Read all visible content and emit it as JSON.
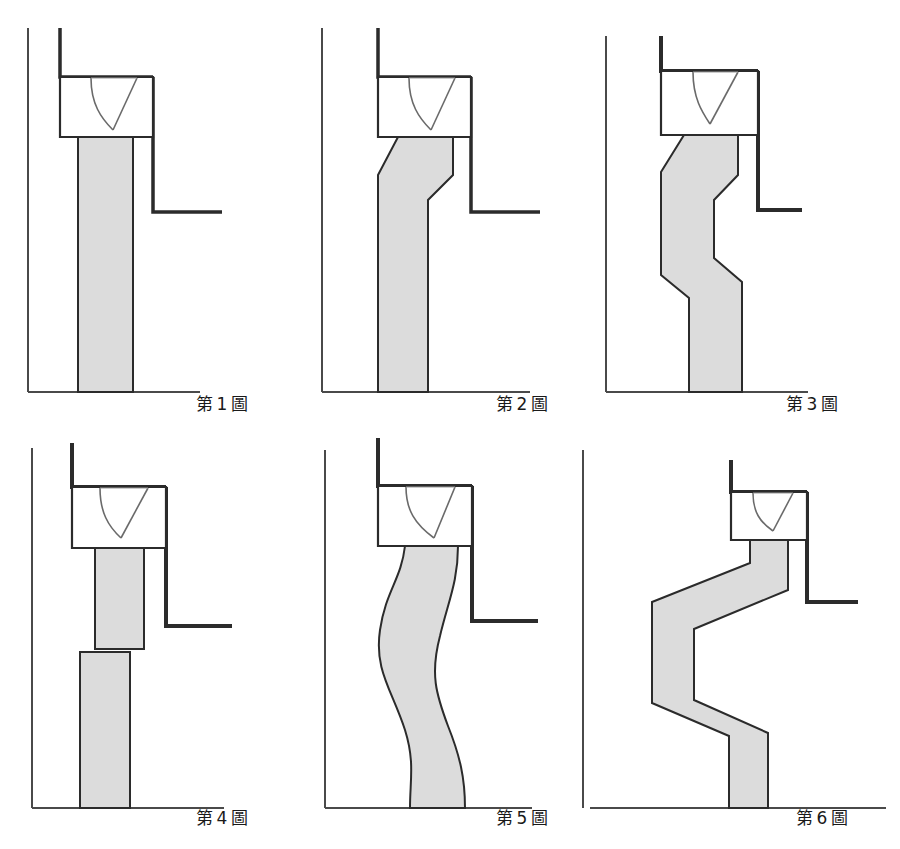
{
  "document": {
    "kind": "patent-drawing-sheet",
    "description": "Six sectional detail figures of a column/pier with a V-notch head connection, showing progressive lateral deviation of the shaft",
    "page_width": 900,
    "page_height": 849
  },
  "style": {
    "shaft_fill": "#dcdcdc",
    "shaft_stroke": "#2b2b2b",
    "wall_stroke": "#2b2b2b",
    "thin_stroke": "#4a4a4a",
    "background": "#ffffff",
    "caption_color": "#1a1a1a"
  },
  "figures": [
    {
      "id": "figure-1",
      "caption_prefix": "第",
      "caption_number": "1",
      "caption_suffix": "圖",
      "caption_full": "第 1 圖",
      "shaft_type": "straight",
      "deviation": "none",
      "notch": "v-notch",
      "head_box": true,
      "ground_line": true
    },
    {
      "id": "figure-2",
      "caption_prefix": "第",
      "caption_number": "2",
      "caption_suffix": "圖",
      "caption_full": "第 2 圖",
      "shaft_type": "single-jog",
      "deviation": "small",
      "notch": "v-notch",
      "head_box": true,
      "ground_line": true
    },
    {
      "id": "figure-3",
      "caption_prefix": "第",
      "caption_number": "3",
      "caption_suffix": "圖",
      "caption_full": "第 3 圖",
      "shaft_type": "double-jog",
      "deviation": "medium",
      "notch": "v-notch",
      "head_box": true,
      "ground_line": true
    },
    {
      "id": "figure-4",
      "caption_prefix": "第",
      "caption_number": "4",
      "caption_suffix": "圖",
      "caption_full": "第 4 圖",
      "shaft_type": "offset-segments",
      "deviation": "discontinuous",
      "notch": "v-notch",
      "head_box": true,
      "ground_line": true
    },
    {
      "id": "figure-5",
      "caption_prefix": "第",
      "caption_number": "5",
      "caption_suffix": "圖",
      "caption_full": "第 5 圖",
      "shaft_type": "smooth-s-curve",
      "deviation": "curved",
      "notch": "v-notch",
      "head_box": true,
      "ground_line": true
    },
    {
      "id": "figure-6",
      "caption_prefix": "第",
      "caption_number": "6",
      "caption_suffix": "圖",
      "caption_full": "第 6 圖",
      "shaft_type": "large-zigzag",
      "deviation": "large",
      "notch": "v-notch",
      "head_box": true,
      "ground_line": true
    }
  ]
}
